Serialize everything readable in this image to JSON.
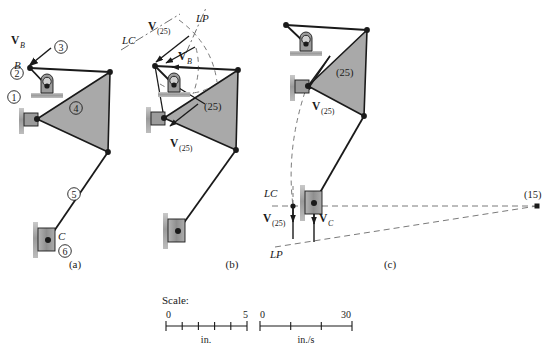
{
  "figure": {
    "panels": [
      {
        "id": "a",
        "caption": "(a)",
        "caption_pos": [
          75,
          268
        ],
        "description": "Kinematic diagram of the mechanism with numbered links and input velocity at B"
      },
      {
        "id": "b",
        "caption": "(b)",
        "caption_pos": [
          232,
          268
        ],
        "description": "Velocity of instant center (25) found by rotating V_B about pivot using lines LC and LP"
      },
      {
        "id": "c",
        "caption": "(c)",
        "caption_pos": [
          390,
          268
        ],
        "description": "Velocity of slider C found from instant center (15) using lines LC and LP"
      }
    ]
  },
  "colors": {
    "stroke": "#1a1a1a",
    "link_fill": "#a9a9a9",
    "support_fill": "#a0a0a0",
    "support_shadow": "#8c8c8c",
    "dashed": "#6e6e6e",
    "text": "#1a1a1a",
    "background": "#ffffff"
  },
  "panel_a": {
    "link_numbers": [
      {
        "label": "①",
        "text": "1",
        "x": 14,
        "y": 97
      },
      {
        "label": "②",
        "text": "2",
        "x": 17,
        "y": 73
      },
      {
        "label": "③",
        "text": "3",
        "x": 61,
        "y": 47
      },
      {
        "label": "④",
        "text": "4",
        "x": 76,
        "y": 108
      },
      {
        "label": "⑤",
        "text": "5",
        "x": 74,
        "y": 194
      },
      {
        "label": "⑥",
        "text": "6",
        "x": 65,
        "y": 251
      }
    ],
    "point_labels": [
      {
        "text": "B",
        "x": 14,
        "y": 65
      },
      {
        "text": "C",
        "x": 46,
        "y": 237
      }
    ],
    "vectors": [
      {
        "name": "V_B",
        "symbol": "V",
        "subscript": "B",
        "x": 11,
        "y": 40
      }
    ]
  },
  "panel_b": {
    "construction_lines": [
      {
        "name": "LC",
        "text": "LC",
        "x": 122,
        "y": 40
      },
      {
        "name": "LP",
        "text": "LP",
        "x": 196,
        "y": 19
      }
    ],
    "point_labels": [
      {
        "text": "(25)",
        "x": 204,
        "y": 106
      }
    ],
    "vectors": [
      {
        "name": "V_25_upper",
        "symbol": "V",
        "subscript": "(25)",
        "x": 152,
        "y": 26
      },
      {
        "name": "V_B",
        "symbol": "V",
        "subscript": "B",
        "x": 178,
        "y": 56
      },
      {
        "name": "V_25_lower",
        "symbol": "V",
        "subscript": "(25)",
        "x": 175,
        "y": 143
      }
    ]
  },
  "panel_c": {
    "construction_lines": [
      {
        "name": "LC",
        "text": "LC",
        "x": 264,
        "y": 193
      },
      {
        "name": "LP",
        "text": "LP",
        "x": 270,
        "y": 254
      }
    ],
    "point_labels": [
      {
        "text": "(25)",
        "x": 336,
        "y": 72
      },
      {
        "text": "(15)",
        "x": 524,
        "y": 194
      }
    ],
    "vectors": [
      {
        "name": "V_25_upper",
        "symbol": "V",
        "subscript": "(25)",
        "x": 316,
        "y": 106
      },
      {
        "name": "V_25_lower",
        "symbol": "V",
        "subscript": "(25)",
        "x": 267,
        "y": 219
      },
      {
        "name": "V_C",
        "symbol": "V",
        "subscript": "C",
        "x": 320,
        "y": 219
      }
    ]
  },
  "scale": {
    "heading": "Scale:",
    "heading_pos": [
      162,
      300
    ],
    "bars": [
      {
        "name": "length-scale",
        "min_label": "0",
        "max_label": "5",
        "unit": "in.",
        "divisions": 5,
        "x0": 166,
        "x1": 247,
        "y": 326
      },
      {
        "name": "velocity-scale",
        "min_label": "0",
        "max_label": "30",
        "unit": "in./s",
        "divisions": 3,
        "x0": 260,
        "x1": 352,
        "y": 326
      }
    ]
  },
  "geometry": {
    "panel_a": {
      "B": [
        30,
        68
      ],
      "pivot2": [
        47,
        86
      ],
      "top_right": [
        110,
        72
      ],
      "pivot4": [
        37,
        119
      ],
      "bottom_right": [
        108,
        152
      ],
      "C": [
        48,
        240
      ]
    },
    "panel_b": {
      "B": [
        155,
        66
      ],
      "pivot2": [
        174,
        85
      ],
      "top_right": [
        238,
        70
      ],
      "pivot4": [
        164,
        118
      ],
      "ic25": [
        198,
        98
      ],
      "bottom_right": [
        236,
        150
      ],
      "C": [
        178,
        231
      ]
    },
    "panel_c": {
      "B": [
        286,
        25
      ],
      "pivot2": [
        306,
        44
      ],
      "top_right": [
        367,
        30
      ],
      "pivot4": [
        308,
        86
      ],
      "ic25": [
        322,
        66
      ],
      "bottom_right": [
        364,
        116
      ],
      "C": [
        314,
        203
      ],
      "ic15": [
        537,
        206
      ]
    }
  }
}
